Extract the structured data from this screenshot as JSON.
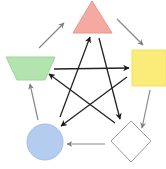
{
  "diagram": {
    "type": "cycle-with-star",
    "width": 166,
    "height": 169,
    "nodes": [
      {
        "id": "triangle",
        "shape": "triangle",
        "fill": "#f4aaa2",
        "stroke": "#e8968c",
        "points": [
          [
            92,
            1
          ],
          [
            73,
            33
          ],
          [
            112,
            33
          ]
        ]
      },
      {
        "id": "square",
        "shape": "square",
        "fill": "#fbeb78",
        "stroke": "#f2df66",
        "x": 132,
        "y": 50,
        "w": 34,
        "h": 36
      },
      {
        "id": "diamond",
        "shape": "diamond",
        "fill": "#ffffff",
        "stroke": "#9a9a9a",
        "points": [
          [
            131,
            121
          ],
          [
            151,
            141
          ],
          [
            131,
            162
          ],
          [
            111,
            141
          ]
        ]
      },
      {
        "id": "circle",
        "shape": "circle",
        "fill": "#b4ccf0",
        "stroke": "#a4bde6",
        "cx": 45,
        "cy": 142,
        "r": 18
      },
      {
        "id": "trapezoid",
        "shape": "trapezoid",
        "fill": "#b3e3ae",
        "stroke": "#9fd69a",
        "points": [
          [
            6,
            57
          ],
          [
            55,
            57
          ],
          [
            45,
            80
          ],
          [
            17,
            80
          ]
        ]
      }
    ],
    "outer_edges": [
      {
        "from": "trapezoid",
        "to": "triangle",
        "color": "#888888",
        "x1": 39,
        "y1": 48,
        "x2": 64,
        "y2": 23
      },
      {
        "from": "triangle",
        "to": "square",
        "color": "#888888",
        "x1": 117,
        "y1": 19,
        "x2": 143,
        "y2": 45
      },
      {
        "from": "square",
        "to": "diamond",
        "color": "#888888",
        "x1": 150,
        "y1": 90,
        "x2": 142,
        "y2": 128
      },
      {
        "from": "diamond",
        "to": "circle",
        "color": "#888888",
        "x1": 105,
        "y1": 144,
        "x2": 67,
        "y2": 144
      },
      {
        "from": "circle",
        "to": "trapezoid",
        "color": "#888888",
        "x1": 38,
        "y1": 120,
        "x2": 30,
        "y2": 84
      }
    ],
    "star_edges": [
      {
        "from": "trapezoid",
        "to": "square",
        "color": "#222222",
        "x1": 54,
        "y1": 69,
        "x2": 129,
        "y2": 68
      },
      {
        "from": "square",
        "to": "circle",
        "color": "#222222",
        "x1": 127,
        "y1": 77,
        "x2": 61,
        "y2": 126
      },
      {
        "from": "circle",
        "to": "triangle",
        "color": "#222222",
        "x1": 60,
        "y1": 117,
        "x2": 90,
        "y2": 37
      },
      {
        "from": "triangle",
        "to": "diamond",
        "color": "#222222",
        "x1": 99,
        "y1": 38,
        "x2": 120,
        "y2": 119
      },
      {
        "from": "diamond",
        "to": "trapezoid",
        "color": "#222222",
        "x1": 115,
        "y1": 123,
        "x2": 49,
        "y2": 74
      }
    ]
  }
}
